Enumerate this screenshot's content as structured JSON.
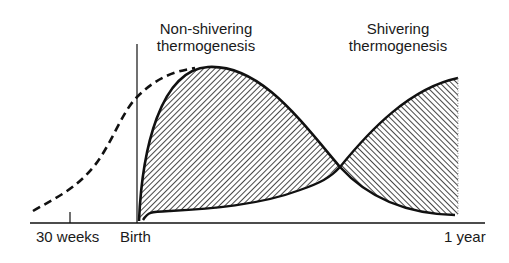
{
  "diagram": {
    "type": "area-curves",
    "title": "",
    "labels": {
      "non_shivering_line1": "Non-shivering",
      "non_shivering_line2": "thermogenesis",
      "shivering_line1": "Shivering",
      "shivering_line2": "thermogenesis"
    },
    "x_axis": {
      "ticks": [
        {
          "label": "30 weeks",
          "x": 70
        },
        {
          "label": "Birth",
          "x": 137
        },
        {
          "label": "1 year",
          "x": 458
        }
      ]
    },
    "series": [
      {
        "name": "Non-shivering thermogenesis",
        "style": "solid, hatched /",
        "peak_x": 208
      },
      {
        "name": "Shivering thermogenesis",
        "style": "solid, hatched \\",
        "rises_toward": "1 year"
      },
      {
        "name": "Pre-birth non-shivering capacity",
        "style": "dashed",
        "from": "30 weeks",
        "to": "Birth"
      }
    ],
    "colors": {
      "line": "#111111",
      "hatch": "#333333",
      "background": "#ffffff"
    }
  }
}
